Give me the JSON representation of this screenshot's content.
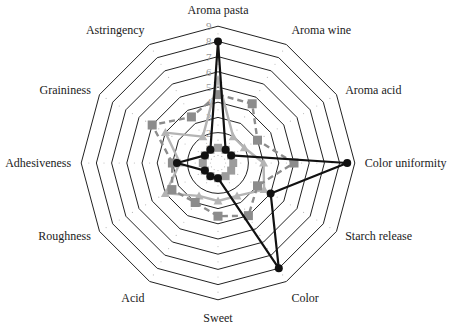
{
  "chart_data": {
    "type": "radar",
    "title": "",
    "axes": [
      "Aroma pasta",
      "Aroma wine",
      "Aroma acid",
      "Color uniformity",
      "Starch release",
      "Color",
      "Sweet",
      "Acid",
      "Roughness",
      "Adhesiveness",
      "Graininess",
      "Astringency"
    ],
    "range": [
      0,
      9
    ],
    "ticks": [
      1,
      2,
      3,
      4,
      5,
      6,
      7,
      8,
      9
    ],
    "tick_labels_axis": "Aroma pasta",
    "grid": true,
    "legend": null,
    "series": [
      {
        "name": "Series 1",
        "style": "solid-black-circle",
        "color": "#111111",
        "values": [
          8,
          1,
          1,
          8.5,
          4,
          8,
          1,
          1,
          1,
          2.7,
          1,
          1
        ]
      },
      {
        "name": "Series 2",
        "style": "dashed-gray-square",
        "color": "#8c8c8c",
        "values": [
          4.5,
          4.5,
          3,
          5,
          3,
          4,
          3.5,
          3,
          3.5,
          3,
          5,
          3.5
        ]
      },
      {
        "name": "Series 3",
        "style": "solid-lightgray-triangle",
        "color": "#b4b4b4",
        "values": [
          5.5,
          2,
          2,
          3,
          3.5,
          2.5,
          2.5,
          2.5,
          4,
          2.5,
          4,
          2
        ]
      },
      {
        "name": "Series 4",
        "style": "solid-gray-square-small",
        "color": "#9c9c9c",
        "values": [
          1,
          1,
          1,
          1,
          1,
          1,
          1,
          1,
          1,
          1,
          1,
          1
        ]
      }
    ]
  },
  "chart": {
    "center_x": 218,
    "center_y": 163,
    "unit_px": 15.2
  }
}
